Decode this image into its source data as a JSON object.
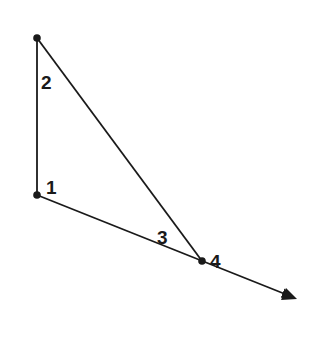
{
  "diagram": {
    "type": "geometry-triangle-exterior-angle",
    "colors": {
      "stroke": "#1a1a1a",
      "background": "#ffffff"
    },
    "points": {
      "top": {
        "x": 37,
        "y": 38
      },
      "vertex1": {
        "x": 37,
        "y": 195
      },
      "vertex4": {
        "x": 202,
        "y": 261
      },
      "arrow_tip": {
        "x": 297,
        "y": 299
      }
    },
    "angle_labels": [
      {
        "id": "angle-1",
        "text": "1",
        "x": 46,
        "y": 194
      },
      {
        "id": "angle-2",
        "text": "2",
        "x": 41,
        "y": 89
      },
      {
        "id": "angle-3",
        "text": "3",
        "x": 157,
        "y": 244
      },
      {
        "id": "angle-4",
        "text": "4",
        "x": 210,
        "y": 268
      }
    ]
  }
}
